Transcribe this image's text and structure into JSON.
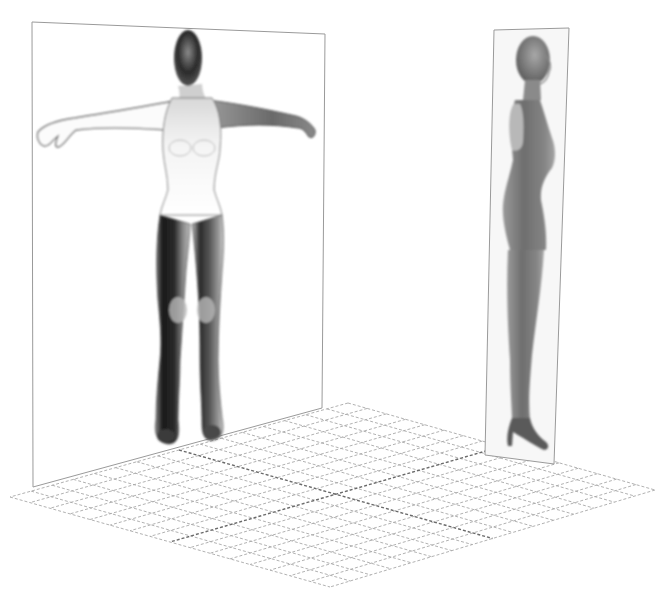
{
  "scene": {
    "description": "3D modeling reference setup: front and side reference image planes over a perspective ground grid",
    "background": "#ffffff",
    "grid_color": "#9a9a9a",
    "grid_axis_color": "#6a6a6a",
    "plane_border_color": "#9a9a9a",
    "front_plane": {
      "view": "front",
      "pose": "T-pose female figure"
    },
    "side_plane": {
      "view": "side",
      "pose": "standing female figure in profile, high heels"
    },
    "ground_grid": {
      "divisions": 16
    }
  }
}
